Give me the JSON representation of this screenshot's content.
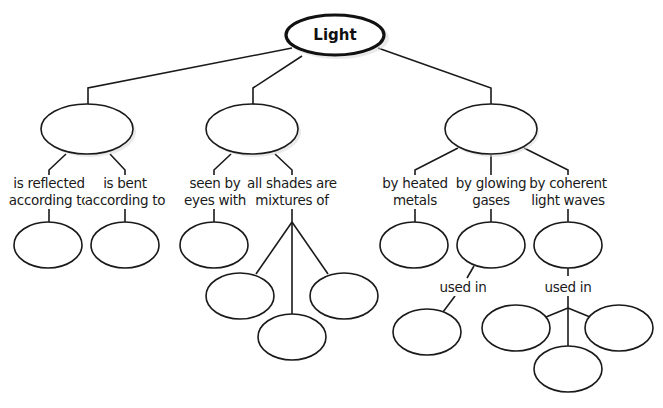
{
  "diagram": {
    "type": "concept-map",
    "root": {
      "label": "Light"
    },
    "branches": [
      {
        "id": "reflection-refraction",
        "node_label": "",
        "links": [
          {
            "line1": "is reflected",
            "line2": "according to",
            "targets": [
              ""
            ]
          },
          {
            "line1": "is bent",
            "line2": "according to",
            "targets": [
              ""
            ]
          }
        ]
      },
      {
        "id": "color",
        "node_label": "",
        "links": [
          {
            "line1": "seen by",
            "line2": "eyes with",
            "targets": [
              ""
            ]
          },
          {
            "line1": "all shades are",
            "line2": "mixtures of",
            "targets": [
              "",
              "",
              ""
            ]
          }
        ]
      },
      {
        "id": "sources",
        "node_label": "",
        "links": [
          {
            "line1": "by heated",
            "line2": "metals",
            "targets": [
              ""
            ]
          },
          {
            "line1": "by glowing",
            "line2": "gases",
            "targets": [
              ""
            ],
            "sub_link": {
              "label": "used in",
              "targets": [
                ""
              ]
            }
          },
          {
            "line1": "by coherent",
            "line2": "light waves",
            "targets": [
              ""
            ],
            "sub_link": {
              "label": "used in",
              "targets": [
                "",
                "",
                ""
              ]
            }
          }
        ]
      }
    ]
  }
}
